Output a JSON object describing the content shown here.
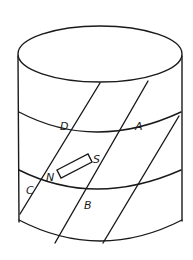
{
  "figure": {
    "labels": {
      "D": "D",
      "A": "A",
      "S": "S",
      "N": "N",
      "C": "C",
      "B": "B"
    },
    "colors": {
      "line": "#1a1a1a",
      "background": "#ffffff"
    }
  }
}
